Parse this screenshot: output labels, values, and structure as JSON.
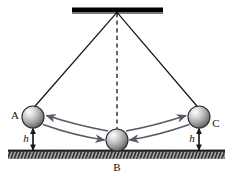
{
  "figure": {
    "background_color": "#ffffff",
    "width": 233,
    "height": 177
  },
  "labels": {
    "ball_a": "A",
    "ball_b": "B",
    "ball_c": "C",
    "height_left": "h",
    "height_right": "h"
  },
  "colors": {
    "support_bar": "#000000",
    "string": "#1a1a1a",
    "dashed_line": "#1a1a1a",
    "ground_fill": "#9a9a9a",
    "ground_line": "#1a1a1a",
    "hatch": "#2b2b2b",
    "arrow": "#5a5a66",
    "sphere_light": "#f2f2f2",
    "sphere_mid": "#b9b9b9",
    "sphere_dark": "#5c5c5c",
    "sphere_outline": "#2a2a2a"
  },
  "geometry": {
    "pivot": {
      "x": 117,
      "y": 11
    },
    "support_bar": {
      "x1": 72,
      "x2": 163,
      "y": 10,
      "thickness": 5
    },
    "ground": {
      "x1": 8,
      "x2": 225,
      "y_top": 150,
      "height": 9
    },
    "ball_a": {
      "cx": 33,
      "cy": 117,
      "r": 11
    },
    "ball_b": {
      "cx": 117,
      "cy": 140,
      "r": 11
    },
    "ball_c": {
      "cx": 199,
      "cy": 117,
      "r": 11
    },
    "height_marker_left": {
      "x": 33,
      "y_top": 128,
      "y_bottom": 150
    },
    "height_marker_right": {
      "x": 199,
      "y_top": 128,
      "y_bottom": 150
    }
  },
  "elements": {
    "support_bar_name": "ceiling-support-bar",
    "pivot_name": "pivot-point",
    "string_left_name": "pendulum-string-left",
    "string_right_name": "pendulum-string-right",
    "dashed_name": "equilibrium-dashed-line",
    "ground_name": "ground-hatched-surface",
    "arc_left_to_a": "arc-arrow-b-to-a",
    "arc_left_to_b": "arc-arrow-a-to-b",
    "arc_right_to_c": "arc-arrow-b-to-c",
    "arc_right_to_b": "arc-arrow-c-to-b"
  }
}
